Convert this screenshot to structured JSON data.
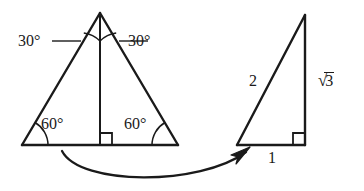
{
  "figure": {
    "background_color": "#ffffff",
    "stroke_color": "#1a1a1a",
    "left_shape": {
      "name": "equilateral-triangle-with-altitude",
      "apex": [
        100,
        13
      ],
      "base_left": [
        22,
        145
      ],
      "base_right": [
        178,
        145
      ],
      "altitude_foot": [
        100,
        145
      ],
      "angle_labels": [
        {
          "id": "30-left",
          "text": "30°",
          "x": 18,
          "y": 33
        },
        {
          "id": "30-right",
          "text": "30°",
          "x": 128,
          "y": 33
        },
        {
          "id": "60-left",
          "text": "60°",
          "x": 41,
          "y": 116
        },
        {
          "id": "60-right",
          "text": "60°",
          "x": 124,
          "y": 116
        }
      ],
      "right_angle_marker": {
        "at": [
          100,
          145
        ],
        "opens": "right"
      }
    },
    "right_shape": {
      "name": "right-triangle-30-60-90",
      "top": [
        305,
        15
      ],
      "bottom_right": [
        305,
        145
      ],
      "bottom_left": [
        237,
        145
      ],
      "side_labels": [
        {
          "id": "hypotenuse",
          "text": "2",
          "x": 249,
          "y": 73
        },
        {
          "id": "vertical-leg",
          "text": "√3",
          "radicand": "3",
          "x": 317,
          "y": 72
        },
        {
          "id": "base-leg",
          "text": "1",
          "x": 268,
          "y": 150
        }
      ],
      "right_angle_marker": {
        "at": [
          305,
          145
        ],
        "opens": "left-up"
      }
    },
    "arrow": {
      "name": "curved-transform-arrow",
      "start": [
        62,
        151
      ],
      "end": [
        248,
        148
      ],
      "direction": "left-to-right",
      "curve": "concave-up"
    }
  },
  "labels": {
    "angle_30_left": "30°",
    "angle_30_right": "30°",
    "angle_60_left": "60°",
    "angle_60_right": "60°",
    "side_2": "2",
    "side_sqrt3_radicand": "3",
    "side_1": "1"
  }
}
